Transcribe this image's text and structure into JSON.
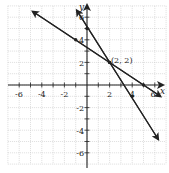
{
  "chart_data": {
    "type": "line",
    "title": "",
    "xlabel": "x",
    "ylabel": "y",
    "xlim": [
      -7,
      7
    ],
    "ylim": [
      -7,
      7
    ],
    "grid": true,
    "x_ticks": [
      -6,
      -4,
      -2,
      2,
      4,
      6
    ],
    "y_ticks": [
      -6,
      -4,
      -2,
      2,
      4,
      6
    ],
    "x_tick_labels": [
      "-6",
      "-4",
      "-2",
      "2",
      "4",
      "6"
    ],
    "y_tick_labels": [
      "-6",
      "-4",
      "-2",
      "2",
      "4",
      "6"
    ],
    "series": [
      {
        "name": "steep line",
        "equation": "y = -1.5x + 5",
        "slope": -1.5,
        "intercept": 5,
        "from": [
          -0.9,
          6.6
        ],
        "to": [
          6.3,
          -4.8
        ],
        "marked_points": [
          [
            0,
            5
          ],
          [
            2,
            2
          ],
          [
            4,
            -1
          ]
        ]
      },
      {
        "name": "shallow line",
        "equation": "y = -2/3x + 10/3",
        "slope": -0.6667,
        "intercept": 3.3333,
        "from": [
          -4.8,
          6.5
        ],
        "to": [
          6.5,
          -1.0
        ],
        "marked_points": [
          [
            -1,
            4
          ],
          [
            2,
            2
          ],
          [
            5,
            0
          ]
        ]
      }
    ],
    "annotations": [
      {
        "text": "(2, 2)",
        "x": 2,
        "y": 2
      }
    ]
  },
  "labels": {
    "x_axis": "x",
    "y_axis": "y",
    "intersection": "(2, 2)",
    "ticks": {
      "xm6": "-6",
      "xm4": "-4",
      "xm2": "-2",
      "x2": "2",
      "x4": "4",
      "x6": "6",
      "ym6": "-6",
      "ym4": "-4",
      "ym2": "-2",
      "y2": "2",
      "y4": "4",
      "y6": "6"
    }
  }
}
